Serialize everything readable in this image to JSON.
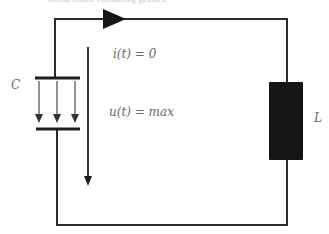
{
  "caption": "Kondensator vollständig geladen",
  "labels": {
    "capacitor": "C",
    "inductor": "L",
    "current": "i(t) = 0",
    "voltage": "u(t) = max"
  },
  "colors": {
    "wire": "#2a2a2a",
    "inductor_fill": "#151515",
    "label": "#6a6a6a",
    "field_arrow": "#4a4a4a"
  }
}
